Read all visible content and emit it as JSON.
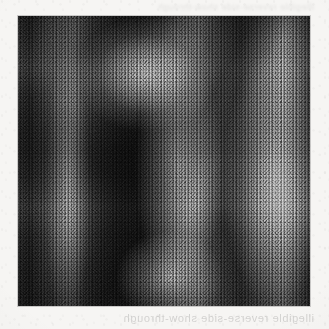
{
  "page": {
    "kind": "scanned-document-page",
    "paper_color": "#f6f5f3",
    "width_px": 329,
    "height_px": 329
  },
  "figure": {
    "label": "",
    "caption": "",
    "kind": "grayscale-grain-image",
    "left_px": 18,
    "top_px": 16,
    "width_px": 292,
    "height_px": 290,
    "border_color": "#787878",
    "darkest_tone": "#131313",
    "lightest_tone": "#9a9a9a",
    "mid_tone": "#4e4e4e"
  },
  "bleed_through": {
    "bottom_line": "illegible reverse-side show-through",
    "top_line": "illegible reverse-side show-through"
  }
}
